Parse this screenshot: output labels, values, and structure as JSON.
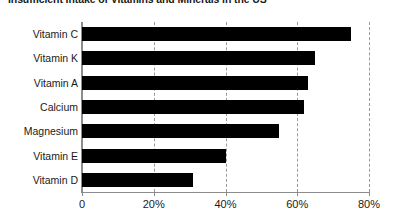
{
  "chart_data": {
    "type": "bar",
    "orientation": "horizontal",
    "title": "Insufficient Intake of Vitamins and Minerals in the US",
    "xlabel": "",
    "ylabel": "",
    "categories": [
      "Vitamin C",
      "Vitamin K",
      "Vitamin A",
      "Calcium",
      "Magnesium",
      "Vitamin E",
      "Vitamin D"
    ],
    "values": [
      75,
      65,
      63,
      62,
      55,
      40,
      31
    ],
    "value_suffix": "%",
    "xlim": [
      0,
      80
    ],
    "tick_values": [
      0,
      20,
      40,
      60,
      80
    ],
    "tick_labels": [
      "0",
      "20%",
      "40%",
      "60%",
      "80%"
    ],
    "grid": "vertical-dashed",
    "legend": "none",
    "bar_color": "#000000",
    "axis_color": "#8c8c8c",
    "grid_color": "#9a9a9a",
    "text_color": "#1a1a1a"
  }
}
